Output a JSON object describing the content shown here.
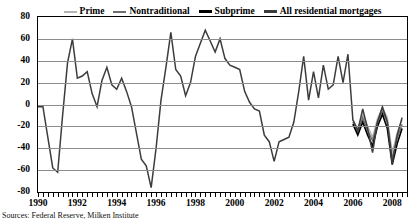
{
  "source_note": "Sources: Federal Reserve, Milken Institute",
  "colors": {
    "prime": "#b4b4b4",
    "nontraditional": "#6e6e6e",
    "subprime": "#000000",
    "all_residential": "#3c3c3c",
    "grid": "#8c8c8c",
    "frame": "#000000"
  },
  "chart_data": {
    "type": "line",
    "title": "",
    "subtitle": "",
    "xlabel": "",
    "ylabel": "",
    "xlim": [
      1990,
      2008.75
    ],
    "ylim": [
      -80,
      80
    ],
    "yticks": [
      -80,
      -60,
      -40,
      -20,
      0,
      20,
      40,
      60,
      80
    ],
    "xticks": [
      1990,
      1992,
      1994,
      1996,
      1998,
      2000,
      2002,
      2004,
      2006,
      2008
    ],
    "xtick_labels": [
      "1990",
      "1992",
      "1994",
      "1996",
      "1998",
      "2000",
      "2002",
      "2004",
      "2006",
      "2008"
    ],
    "ytick_labels": [
      "-80",
      "-60",
      "-40",
      "-20",
      "0",
      "20",
      "40",
      "60",
      "80"
    ],
    "grid": true,
    "minor_xticks_per_year": 4,
    "legend_position": "top-center",
    "series": [
      {
        "name": "Prime",
        "color": "#b4b4b4",
        "width": 1.4,
        "x": [
          2006.0,
          2006.25,
          2006.5,
          2006.75,
          2007.0,
          2007.25,
          2007.5,
          2007.75,
          2008.0,
          2008.25,
          2008.5
        ],
        "values": [
          -14,
          -22,
          -9,
          -20,
          -30,
          -13,
          -3,
          -12,
          -44,
          -26,
          -14
        ]
      },
      {
        "name": "Nontraditional",
        "color": "#6e6e6e",
        "width": 1.4,
        "x": [
          2006.0,
          2006.25,
          2006.5,
          2006.75,
          2007.0,
          2007.25,
          2007.5,
          2007.75,
          2008.0,
          2008.25,
          2008.5
        ],
        "values": [
          -16,
          -25,
          -12,
          -24,
          -33,
          -16,
          -6,
          -16,
          -49,
          -31,
          -18
        ]
      },
      {
        "name": "Subprime",
        "color": "#000000",
        "width": 1.6,
        "x": [
          2006.0,
          2006.25,
          2006.5,
          2006.75,
          2007.0,
          2007.25,
          2007.5,
          2007.75,
          2008.0,
          2008.25,
          2008.5
        ],
        "values": [
          -18,
          -28,
          -16,
          -28,
          -38,
          -20,
          -9,
          -22,
          -55,
          -36,
          -22
        ]
      },
      {
        "name": "All residential mortgages",
        "color": "#3c3c3c",
        "width": 1.5,
        "x": [
          1990.0,
          1990.25,
          1990.5,
          1990.75,
          1991.0,
          1991.25,
          1991.5,
          1991.75,
          1992.0,
          1992.25,
          1992.5,
          1992.75,
          1993.0,
          1993.25,
          1993.5,
          1993.75,
          1994.0,
          1994.25,
          1994.5,
          1994.75,
          1995.0,
          1995.25,
          1995.5,
          1995.75,
          1996.0,
          1996.25,
          1996.5,
          1996.75,
          1997.0,
          1997.25,
          1997.5,
          1997.75,
          1998.0,
          1998.25,
          1998.5,
          1998.75,
          1999.0,
          1999.25,
          1999.5,
          1999.75,
          2000.0,
          2000.25,
          2000.5,
          2000.75,
          2001.0,
          2001.25,
          2001.5,
          2001.75,
          2002.0,
          2002.25,
          2002.5,
          2002.75,
          2003.0,
          2003.25,
          2003.5,
          2003.75,
          2004.0,
          2004.25,
          2004.5,
          2004.75,
          2005.0,
          2005.25,
          2005.5,
          2005.75,
          2006.0,
          2006.25,
          2006.5,
          2006.75,
          2007.0,
          2007.25,
          2007.5,
          2007.75,
          2008.0,
          2008.25,
          2008.5
        ],
        "values": [
          -2,
          -2,
          -30,
          -58,
          -62,
          -10,
          38,
          60,
          24,
          26,
          30,
          10,
          -2,
          22,
          34,
          18,
          14,
          24,
          12,
          -2,
          -26,
          -50,
          -56,
          -76,
          -40,
          4,
          34,
          66,
          32,
          26,
          8,
          20,
          44,
          56,
          68,
          58,
          48,
          60,
          42,
          36,
          34,
          32,
          12,
          2,
          -4,
          -6,
          -28,
          -34,
          -52,
          -34,
          -32,
          -30,
          -16,
          12,
          44,
          4,
          30,
          6,
          36,
          14,
          18,
          44,
          20,
          46,
          -14,
          -24,
          -4,
          -22,
          -44,
          -16,
          -2,
          -16,
          -54,
          -28,
          -12
        ]
      }
    ]
  },
  "legend": {
    "items": [
      {
        "label": "Prime",
        "color": "#b4b4b4",
        "width": 2
      },
      {
        "label": "Nontraditional",
        "color": "#6e6e6e",
        "width": 2
      },
      {
        "label": "Subprime",
        "color": "#000000",
        "width": 3
      },
      {
        "label": "All residential mortgages",
        "color": "#3c3c3c",
        "width": 3
      }
    ]
  }
}
